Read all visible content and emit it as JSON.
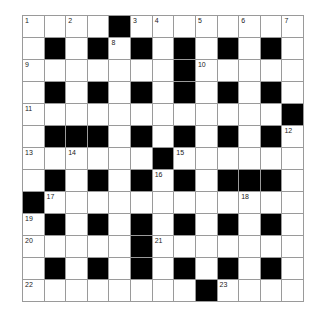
{
  "puzzle": {
    "rows": 13,
    "cols": 13,
    "layout": [
      "WWWWBWWWWWWWW",
      "WBWBWBWBWBWBW",
      "WWWWWWWBWWWWW",
      "WBWBWBWBWBWBW",
      "WWWWWWWWWWWWB",
      "WBBBWBWBWBWBW",
      "WWWWWWBWWWWWW",
      "WBWBWBWBWBBBW",
      "BWWWWWWWWWWWW",
      "WBWBWBWBWBWBW",
      "WWWWWBWWWWWWW",
      "WBWBWBWBWBWBW",
      "WWWWWWWWBWWWW"
    ],
    "numbers": [
      {
        "r": 0,
        "c": 0,
        "n": "1"
      },
      {
        "r": 0,
        "c": 2,
        "n": "2"
      },
      {
        "r": 0,
        "c": 5,
        "n": "3"
      },
      {
        "r": 0,
        "c": 6,
        "n": "4"
      },
      {
        "r": 0,
        "c": 8,
        "n": "5"
      },
      {
        "r": 0,
        "c": 10,
        "n": "6"
      },
      {
        "r": 0,
        "c": 12,
        "n": "7"
      },
      {
        "r": 1,
        "c": 4,
        "n": "8"
      },
      {
        "r": 2,
        "c": 0,
        "n": "9"
      },
      {
        "r": 2,
        "c": 8,
        "n": "10"
      },
      {
        "r": 4,
        "c": 0,
        "n": "11"
      },
      {
        "r": 5,
        "c": 12,
        "n": "12"
      },
      {
        "r": 6,
        "c": 0,
        "n": "13"
      },
      {
        "r": 6,
        "c": 2,
        "n": "14"
      },
      {
        "r": 6,
        "c": 7,
        "n": "15"
      },
      {
        "r": 7,
        "c": 6,
        "n": "16"
      },
      {
        "r": 8,
        "c": 1,
        "n": "17"
      },
      {
        "r": 8,
        "c": 10,
        "n": "18"
      },
      {
        "r": 9,
        "c": 0,
        "n": "19"
      },
      {
        "r": 10,
        "c": 0,
        "n": "20"
      },
      {
        "r": 10,
        "c": 6,
        "n": "21"
      },
      {
        "r": 12,
        "c": 0,
        "n": "22"
      },
      {
        "r": 12,
        "c": 9,
        "n": "23"
      }
    ],
    "colors": {
      "block": "#000000",
      "cell": "#ffffff",
      "gridline": "#9a9a9a",
      "number": "#222222"
    }
  }
}
